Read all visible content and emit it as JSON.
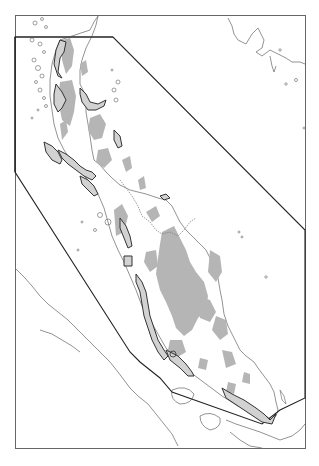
{
  "map": {
    "width": 319,
    "height": 466,
    "frame": {
      "x": 15,
      "y": 15,
      "w": 290,
      "h": 434
    },
    "colors": {
      "background": "#ffffff",
      "frame": "#555555",
      "coastline": "#777777",
      "highland": "#b3b3b3",
      "boundary": "#222222",
      "coastal_zone": "#333333",
      "coastal_zone_fill": "#c8c8c8"
    },
    "layers": [
      {
        "id": "coastline",
        "label": ""
      },
      {
        "id": "highland-shading",
        "label": ""
      },
      {
        "id": "study-area-boundary",
        "label": ""
      },
      {
        "id": "coastal-zones",
        "label": ""
      }
    ],
    "visible_text": []
  }
}
